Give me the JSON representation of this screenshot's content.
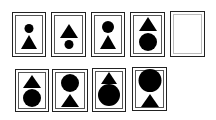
{
  "puzzle": {
    "top_row": [
      {
        "label": "panel-1",
        "top": "circle",
        "bottom": "triangle",
        "circle_size": "small",
        "triangle_size": "large"
      },
      {
        "label": "panel-2",
        "top": "triangle",
        "bottom": "circle",
        "circle_size": "small",
        "triangle_size": "large"
      },
      {
        "label": "panel-3",
        "top": "circle",
        "bottom": "triangle",
        "circle_size": "medium",
        "triangle_size": "large"
      },
      {
        "label": "panel-4",
        "top": "triangle",
        "bottom": "circle",
        "circle_size": "large",
        "triangle_size": "large"
      },
      {
        "label": "panel-blank",
        "top": null,
        "bottom": null
      }
    ],
    "answer_options": [
      {
        "label": "option-1",
        "top": "triangle",
        "bottom": "circle",
        "circle_size": "large",
        "triangle_size": "medium"
      },
      {
        "label": "option-2",
        "top": "circle",
        "bottom": "triangle",
        "circle_size": "large",
        "triangle_size": "medium"
      },
      {
        "label": "option-3",
        "top": "triangle",
        "bottom": "circle",
        "circle_size": "xlarge",
        "triangle_size": "medium"
      },
      {
        "label": "option-4",
        "top": "circle",
        "bottom": "triangle",
        "circle_size": "xlarge",
        "triangle_size": "medium"
      }
    ],
    "colors": {
      "shape": "#000000",
      "border": "#222222",
      "background": "#ffffff"
    }
  }
}
